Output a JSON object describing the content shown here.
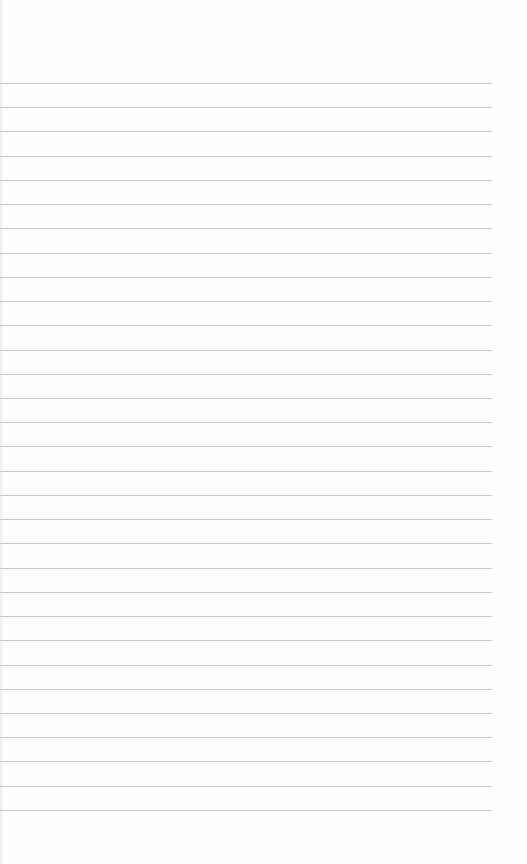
{
  "page": {
    "type": "lined-paper",
    "background": "#fefefe",
    "line_color": "#c9c9c9",
    "line_count": 31,
    "first_line_y": 83,
    "line_spacing": 24.23,
    "line_width": 492
  }
}
